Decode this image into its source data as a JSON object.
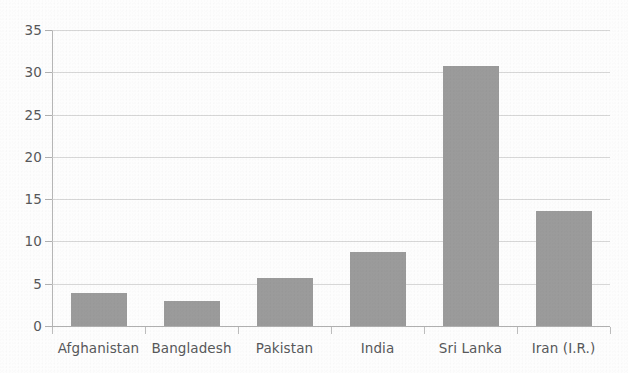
{
  "chart_data": {
    "type": "bar",
    "title": "",
    "subtitle": "",
    "xlabel": "",
    "ylabel": "",
    "categories": [
      "Afghanistan",
      "Bangladesh",
      "Pakistan",
      "India",
      "Sri Lanka",
      "Iran (I.R.)"
    ],
    "values": [
      3.9,
      2.9,
      5.7,
      8.8,
      30.8,
      13.6
    ],
    "ylim": [
      0,
      35
    ],
    "yticks": [
      0,
      5,
      10,
      15,
      20,
      25,
      30,
      35
    ],
    "ytick_labels": [
      "0",
      "5",
      "10",
      "15",
      "20",
      "25",
      "30",
      "35"
    ],
    "grid": true,
    "grid_axis": "y",
    "legend": false,
    "legend_position": "none",
    "bar_color": "#9b9b9b",
    "grid_color": "#c9c9c9",
    "axis_color": "#b0b0b0",
    "text_color": "#57585a",
    "background_color": "#fdfdfd"
  },
  "axis": {
    "y_ticks": [
      {
        "label": "35",
        "value": 35
      },
      {
        "label": "30",
        "value": 30
      },
      {
        "label": "25",
        "value": 25
      },
      {
        "label": "20",
        "value": 20
      },
      {
        "label": "15",
        "value": 15
      },
      {
        "label": "10",
        "value": 10
      },
      {
        "label": "5",
        "value": 5
      },
      {
        "label": "0",
        "value": 0
      }
    ],
    "x_categories": [
      {
        "label": "Afghanistan"
      },
      {
        "label": "Bangladesh"
      },
      {
        "label": "Pakistan"
      },
      {
        "label": "India"
      },
      {
        "label": "Sri Lanka"
      },
      {
        "label": "Iran (I.R.)"
      }
    ]
  },
  "bars": [
    {
      "label": "Afghanistan",
      "value": 3.9
    },
    {
      "label": "Bangladesh",
      "value": 2.9
    },
    {
      "label": "Pakistan",
      "value": 5.7
    },
    {
      "label": "India",
      "value": 8.8
    },
    {
      "label": "Sri Lanka",
      "value": 30.8
    },
    {
      "label": "Iran (I.R.)",
      "value": 13.6
    }
  ]
}
